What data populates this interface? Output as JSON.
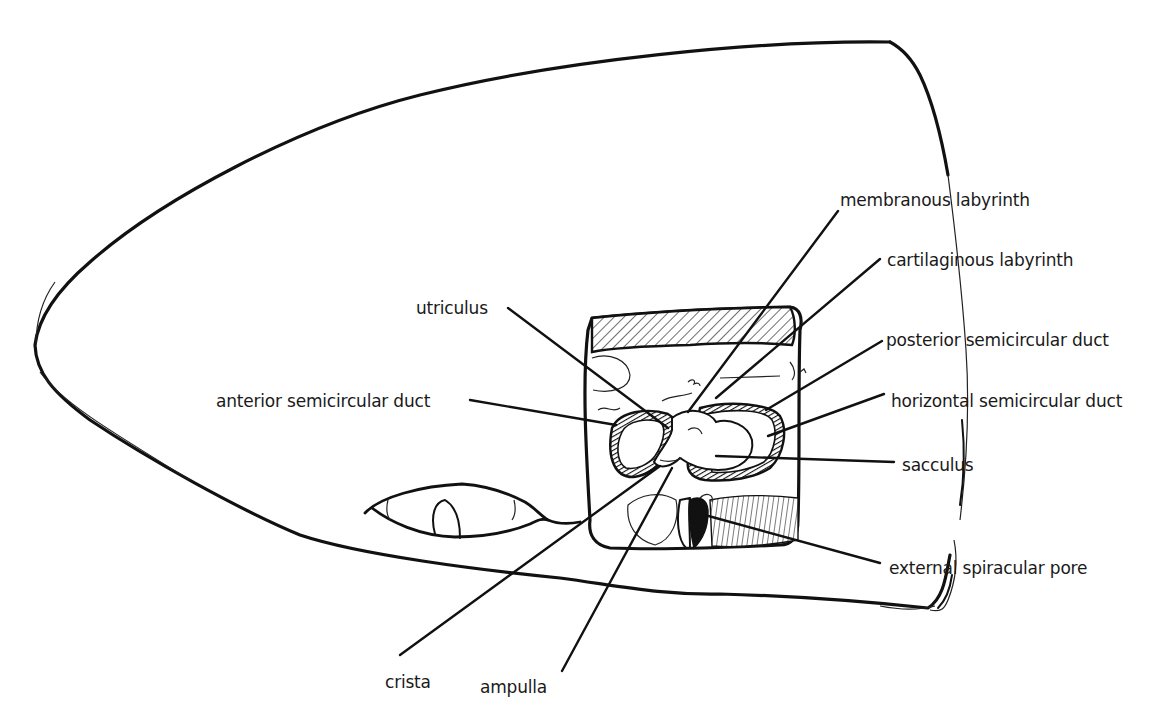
{
  "figure": {
    "labels": [
      {
        "id": "membranous_labyrinth",
        "text": "membranous labyrinth",
        "x": 840,
        "y": 190
      },
      {
        "id": "cartilaginous_labyrinth",
        "text": "cartilaginous labyrinth",
        "x": 887,
        "y": 250
      },
      {
        "id": "utriculus",
        "text": "utriculus",
        "x": 416,
        "y": 298
      },
      {
        "id": "posterior_semicircular_duct",
        "text": "posterior semicircular duct",
        "x": 886,
        "y": 330
      },
      {
        "id": "anterior_semicircular_duct",
        "text": "anterior semicircular duct",
        "x": 216,
        "y": 391
      },
      {
        "id": "horizontal_semicircular_duct",
        "text": "horizontal semicircular duct",
        "x": 891,
        "y": 391
      },
      {
        "id": "sacculus",
        "text": "sacculus",
        "x": 902,
        "y": 455
      },
      {
        "id": "external_spiracular_pore",
        "text": "external spiracular pore",
        "x": 889,
        "y": 558
      },
      {
        "id": "crista",
        "text": "crista",
        "x": 385,
        "y": 672
      },
      {
        "id": "ampulla",
        "text": "ampulla",
        "x": 480,
        "y": 677
      }
    ],
    "colors": {
      "ink": "#111111",
      "paper": "#ffffff"
    }
  }
}
